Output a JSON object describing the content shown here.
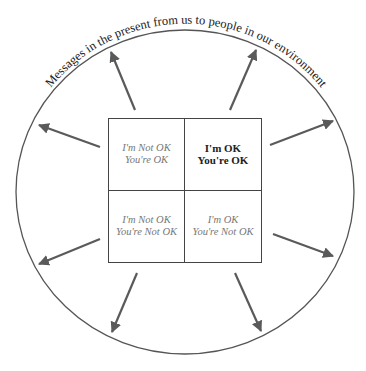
{
  "diagram": {
    "arc_label": "Messages in the present from us to people in our environment",
    "colors": {
      "line": "#555555",
      "arrow": "#5a5a5a",
      "text_muted": "#777777",
      "text_strong": "#222222"
    },
    "quadrants": [
      {
        "position": "top-left",
        "line1": "I'm Not OK",
        "line2": "You're OK",
        "emphasized": false
      },
      {
        "position": "top-right",
        "line1": "I'm OK",
        "line2": "You're OK",
        "emphasized": true
      },
      {
        "position": "bottom-left",
        "line1": "I'm Not OK",
        "line2": "You're Not OK",
        "emphasized": false
      },
      {
        "position": "bottom-right",
        "line1": "I'm OK",
        "line2": "You're Not OK",
        "emphasized": false
      }
    ],
    "arrow_count": 8
  }
}
